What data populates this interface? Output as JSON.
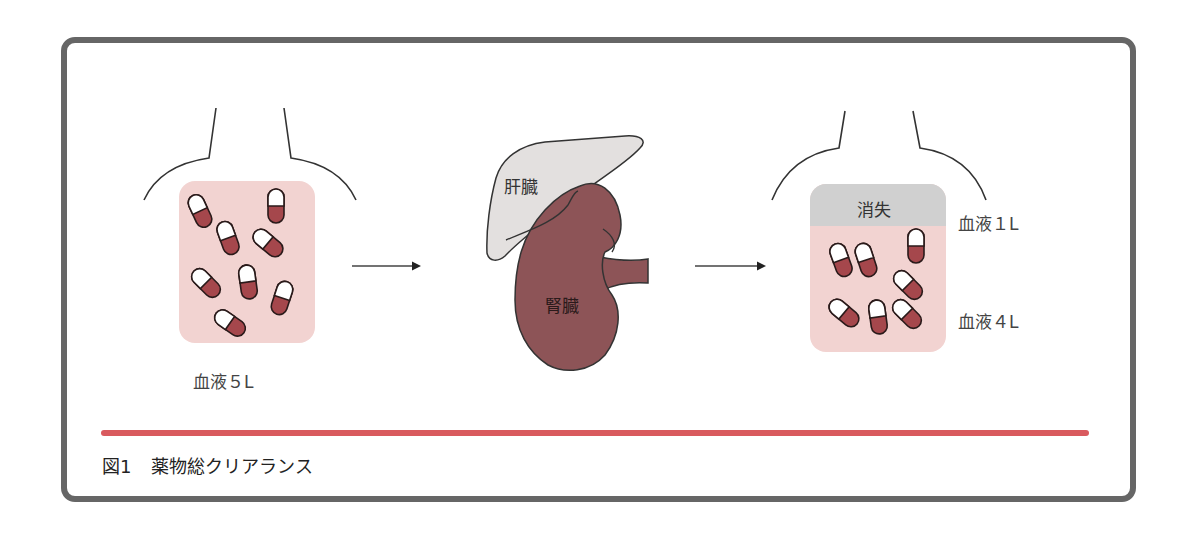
{
  "figure": {
    "caption_number": "図1",
    "caption_title": "薬物総クリアランス"
  },
  "left_panel": {
    "blood_label": "血液５L",
    "capsule_count": 8
  },
  "middle_panel": {
    "liver_label": "肝臓",
    "kidney_label": "腎臓"
  },
  "right_panel": {
    "eliminated_label": "消失",
    "blood_top_label": "血液１L",
    "blood_bottom_label": "血液４L",
    "capsule_count": 8
  },
  "colors": {
    "frame": "#666666",
    "blood_pink": "#f2d3d1",
    "eliminated_gray": "#d0d0d0",
    "capsule_red": "#a5474c",
    "kidney": "#8d5457",
    "liver": "#e3e0df",
    "accent_line": "#d95a5e"
  }
}
